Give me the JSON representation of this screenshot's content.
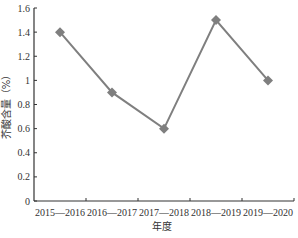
{
  "chart_data": {
    "type": "line",
    "title": "",
    "xlabel": "年度",
    "ylabel": "芥酸含量（%）",
    "categories": [
      "2015—2016",
      "2016—2017",
      "2017—2018",
      "2018—2019",
      "2019—2020"
    ],
    "series": [
      {
        "name": "芥酸含量",
        "values": [
          1.4,
          0.9,
          0.6,
          1.5,
          1.0
        ],
        "color": "#7f7f7f",
        "marker": "diamond"
      }
    ],
    "ylim": [
      0,
      1.6
    ],
    "yticks": [
      0,
      0.2,
      0.4,
      0.6,
      0.8,
      1,
      1.2,
      1.4,
      1.6
    ],
    "ytick_labels": [
      "0",
      "0.2",
      "0.4",
      "0.6",
      "0.8",
      "1",
      "1.2",
      "1.4",
      "1.6"
    ],
    "grid": false,
    "legend": "none"
  }
}
